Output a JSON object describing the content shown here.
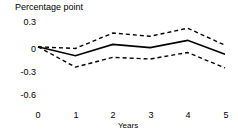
{
  "chart_data": {
    "type": "line",
    "title": "",
    "xlabel": "Years",
    "ylabel": "Percentage point",
    "x": [
      0,
      1,
      2,
      3,
      4,
      5
    ],
    "xtick_labels": [
      "0",
      "1",
      "2",
      "3",
      "4",
      "5"
    ],
    "ytick_labels": [
      "0.3",
      "0",
      "-0.3",
      "-0.6"
    ],
    "ytick_values": [
      0.3,
      0,
      -0.3,
      -0.6
    ],
    "ylim": [
      -0.6,
      0.3
    ],
    "xlim": [
      0,
      5
    ],
    "grid": false,
    "legend": "none",
    "series": [
      {
        "name": "upper-confidence-band",
        "style": "dashed",
        "color": "#000000",
        "values": [
          0,
          -0.02,
          0.17,
          0.13,
          0.23,
          0.02
        ]
      },
      {
        "name": "point-estimate",
        "style": "solid",
        "color": "#000000",
        "values": [
          0,
          -0.11,
          0.03,
          -0.01,
          0.08,
          -0.09
        ]
      },
      {
        "name": "lower-confidence-band",
        "style": "dashed",
        "color": "#000000",
        "values": [
          0,
          -0.25,
          -0.13,
          -0.15,
          -0.07,
          -0.26
        ]
      }
    ]
  },
  "axes": {
    "y_title": "Percentage point",
    "x_title": "Years",
    "yticks": [
      {
        "label": "0.3",
        "top": 18
      },
      {
        "label": "0",
        "top": 45
      },
      {
        "label": "-0.3",
        "top": 68
      },
      {
        "label": "-0.6",
        "top": 91
      }
    ],
    "xticks": [
      {
        "label": "0",
        "left": 31
      },
      {
        "label": "1",
        "left": 69
      },
      {
        "label": "2",
        "left": 106
      },
      {
        "label": "3",
        "left": 144
      },
      {
        "label": "4",
        "left": 181
      },
      {
        "label": "5",
        "left": 219
      }
    ]
  },
  "colors": {
    "background": "#ffffff",
    "ink": "#000000",
    "axis": "#000000"
  }
}
